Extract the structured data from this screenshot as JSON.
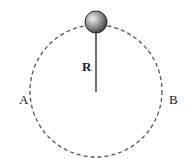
{
  "diagram": {
    "title": "",
    "labels": {
      "radius": "R",
      "left_point": "A",
      "right_point": "B"
    },
    "path": {
      "type": "dashed-circle",
      "center": [
        96,
        91
      ],
      "radius": 66,
      "color": "#555555"
    },
    "rod": {
      "from": [
        96,
        33
      ],
      "to": [
        96,
        92
      ],
      "color": "#333333"
    },
    "ball": {
      "center": [
        96,
        22
      ],
      "radius": 11,
      "color_light": "#dddddd",
      "color_dark": "#333333"
    }
  }
}
